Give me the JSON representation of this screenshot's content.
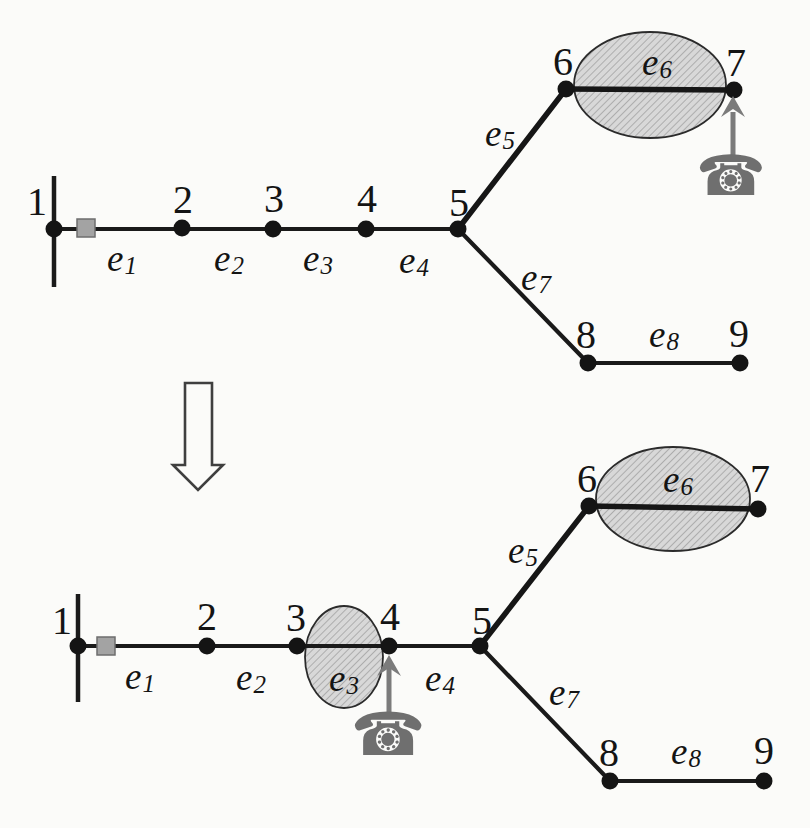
{
  "figure": {
    "kind": "graph-transformation",
    "transform_arrow_direction": "down"
  },
  "icons": {
    "phone_glyph": "☎"
  },
  "colors": {
    "ink": "#1a1a1a",
    "paper": "#fbfbf9",
    "highlight_fill": "#d8d8d8",
    "highlight_hatch": "#a6a6a6",
    "highlight_stroke": "#2b2b2b",
    "phone_gray": "#6f6f6f",
    "pointer_gray": "#7b7b7b",
    "tap_square": "#a3a3a3",
    "tap_square_border": "#6e6e6e",
    "transform_arrow_stroke": "#3f3f3f"
  },
  "diagrams": [
    {
      "name": "before",
      "nodes": [
        {
          "label": "1"
        },
        {
          "label": "2"
        },
        {
          "label": "3"
        },
        {
          "label": "4"
        },
        {
          "label": "5"
        },
        {
          "label": "6"
        },
        {
          "label": "7"
        },
        {
          "label": "8"
        },
        {
          "label": "9"
        }
      ],
      "edges": [
        {
          "name": "e",
          "sub": "1"
        },
        {
          "name": "e",
          "sub": "2"
        },
        {
          "name": "e",
          "sub": "3"
        },
        {
          "name": "e",
          "sub": "4"
        },
        {
          "name": "e",
          "sub": "5"
        },
        {
          "name": "e",
          "sub": "6"
        },
        {
          "name": "e",
          "sub": "7"
        },
        {
          "name": "e",
          "sub": "8"
        }
      ],
      "highlighted_edges": [
        "e6"
      ],
      "phone_at_node": "7",
      "tap_marker_on_edge": "e1"
    },
    {
      "name": "after",
      "nodes": [
        {
          "label": "1"
        },
        {
          "label": "2"
        },
        {
          "label": "3"
        },
        {
          "label": "4"
        },
        {
          "label": "5"
        },
        {
          "label": "6"
        },
        {
          "label": "7"
        },
        {
          "label": "8"
        },
        {
          "label": "9"
        }
      ],
      "edges": [
        {
          "name": "e",
          "sub": "1"
        },
        {
          "name": "e",
          "sub": "2"
        },
        {
          "name": "e",
          "sub": "3"
        },
        {
          "name": "e",
          "sub": "4"
        },
        {
          "name": "e",
          "sub": "5"
        },
        {
          "name": "e",
          "sub": "6"
        },
        {
          "name": "e",
          "sub": "7"
        },
        {
          "name": "e",
          "sub": "8"
        }
      ],
      "highlighted_edges": [
        "e3",
        "e6"
      ],
      "phone_at_node": "4",
      "tap_marker_on_edge": "e1"
    }
  ]
}
